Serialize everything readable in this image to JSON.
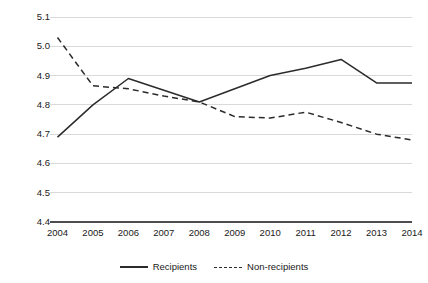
{
  "chart_data": {
    "type": "line",
    "title": "",
    "xlabel": "",
    "ylabel": "Freedom of the press (1 to 10 best)",
    "categories": [
      "2004",
      "2005",
      "2006",
      "2007",
      "2008",
      "2009",
      "2010",
      "2011",
      "2012",
      "2013",
      "2014"
    ],
    "x": [
      2004,
      2005,
      2006,
      2007,
      2008,
      2009,
      2010,
      2011,
      2012,
      2013,
      2014
    ],
    "ylim": [
      4.4,
      5.1
    ],
    "xlim": [
      2004,
      2014
    ],
    "yticks": [
      "5.1",
      "5.0",
      "4.9",
      "4.8",
      "4.7",
      "4.6",
      "4.5",
      "4.4"
    ],
    "ytick_values": [
      5.1,
      5.0,
      4.9,
      4.8,
      4.7,
      4.6,
      4.5,
      4.4
    ],
    "grid": true,
    "grid_axis": "y",
    "legend_position": "bottom",
    "series": [
      {
        "name": "Recipients",
        "style": "solid",
        "color": "#2b2b2b",
        "values": [
          4.69,
          4.8,
          4.89,
          4.85,
          4.81,
          4.855,
          4.9,
          4.925,
          4.955,
          4.875,
          4.875
        ]
      },
      {
        "name": "Non-recipients",
        "style": "dashed",
        "color": "#2b2b2b",
        "values": [
          5.03,
          4.865,
          4.855,
          4.83,
          4.81,
          4.76,
          4.755,
          4.775,
          4.74,
          4.7,
          4.68
        ]
      }
    ]
  },
  "legend": {
    "entries": [
      {
        "label": "Recipients",
        "style": "solid"
      },
      {
        "label": "Non-recipients",
        "style": "dashed"
      }
    ]
  },
  "colors": {
    "line": "#2b2b2b",
    "grid": "#d9d9d9",
    "axis": "#4d4d4d",
    "text": "#1a1a1a",
    "background": "#ffffff"
  }
}
